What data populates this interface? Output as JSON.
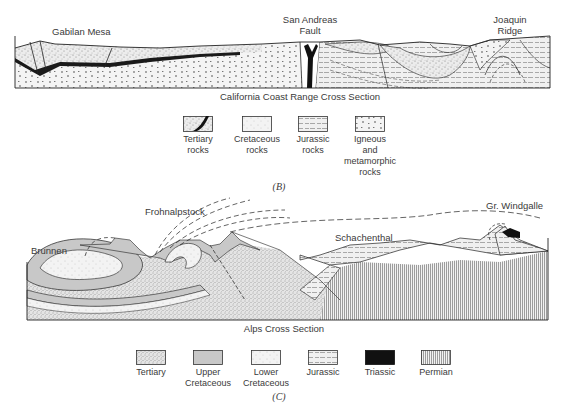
{
  "figure_b": {
    "labels": {
      "gabilan_mesa": "Gabilan Mesa",
      "san_andreas": "San Andreas",
      "fault": "Fault",
      "joaquin": "Joaquin",
      "ridge": "Ridge"
    },
    "title": "California Coast Range Cross Section",
    "legend": [
      {
        "line1": "Tertiary",
        "line2": "rocks",
        "line3": "",
        "line4": "",
        "pattern": "tertiary-dotted-with-black-band"
      },
      {
        "line1": "Cretaceous",
        "line2": "rocks",
        "line3": "",
        "line4": "",
        "pattern": "fine-stipple"
      },
      {
        "line1": "Jurassic",
        "line2": "rocks",
        "line3": "",
        "line4": "",
        "pattern": "dashed-lines"
      },
      {
        "line1": "Igneous",
        "line2": "and",
        "line3": "metamorphic",
        "line4": "rocks",
        "pattern": "sparse-dots"
      }
    ],
    "panel_label": "(B)"
  },
  "figure_c": {
    "labels": {
      "frohnalpstock": "Frohnalpstock",
      "brunnen": "Brunnen",
      "schachenthal": "Schachenthal",
      "gr_windgalle": "Gr. Windgalle"
    },
    "title": "Alps Cross Section",
    "legend": [
      {
        "line1": "Tertiary",
        "line2": "",
        "pattern": "dense-stipple"
      },
      {
        "line1": "Upper",
        "line2": "Cretaceous",
        "pattern": "gray-fill"
      },
      {
        "line1": "Lower",
        "line2": "Cretaceous",
        "pattern": "light-stipple"
      },
      {
        "line1": "Jurassic",
        "line2": "",
        "pattern": "dashed-lines"
      },
      {
        "line1": "Triassic",
        "line2": "",
        "pattern": "solid-black"
      },
      {
        "line1": "Permian",
        "line2": "",
        "pattern": "vertical-lines"
      }
    ],
    "panel_label": "(C)"
  },
  "colors": {
    "ink": "#1a1a1a",
    "gray_fill": "#c8c8c8",
    "stipple": "#e6e6e6",
    "text": "#3a3a3a"
  }
}
